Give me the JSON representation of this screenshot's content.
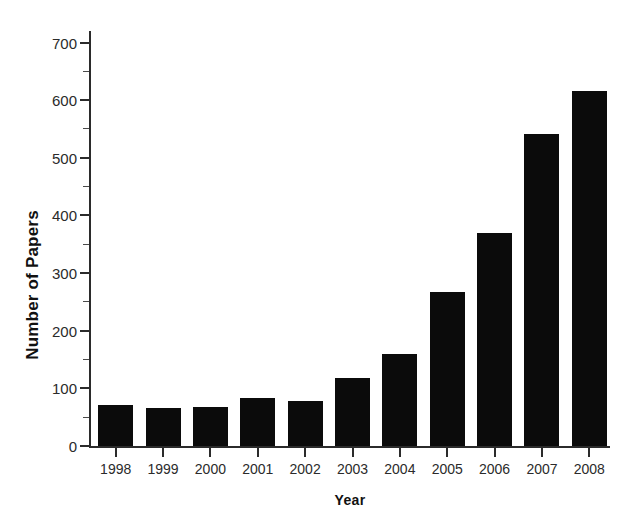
{
  "chart_data": {
    "type": "bar",
    "title": "",
    "subtitle": "",
    "xlabel": "Year",
    "ylabel": "Number of Papers",
    "categories": [
      "1998",
      "1999",
      "2000",
      "2001",
      "2002",
      "2003",
      "2004",
      "2005",
      "2006",
      "2007",
      "2008"
    ],
    "values": [
      72,
      66,
      68,
      83,
      78,
      118,
      160,
      268,
      370,
      542,
      616
    ],
    "series": [
      {
        "name": "Number of Papers",
        "values": [
          72,
          66,
          68,
          83,
          78,
          118,
          160,
          268,
          370,
          542,
          616
        ]
      }
    ],
    "ylim": [
      0,
      720
    ],
    "xlim_categories": 11,
    "y_major_ticks": [
      0,
      100,
      200,
      300,
      400,
      500,
      600,
      700
    ],
    "y_major_tick_labels": [
      "0",
      "100",
      "200",
      "300",
      "400",
      "500",
      "600",
      "700"
    ],
    "y_minor_ticks": [
      50,
      150,
      250,
      350,
      450,
      550,
      650
    ],
    "grid": false,
    "legend": null,
    "legend_position": "none",
    "bar_color": "#0b0b0b",
    "axis_color": "#2b2b2b",
    "background_color": "#ffffff",
    "annotations": []
  }
}
